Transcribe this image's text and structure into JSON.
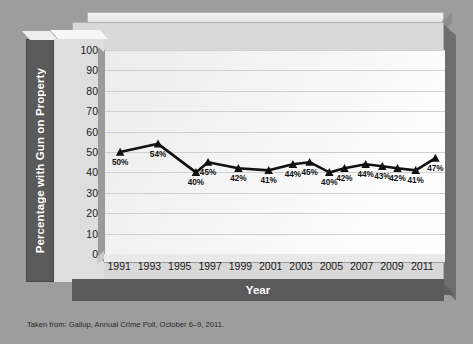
{
  "chart_data": {
    "type": "line",
    "title": "",
    "xlabel": "Year",
    "ylabel": "Percentage with Gun on Property",
    "xlim": [
      1990,
      2012.5
    ],
    "ylim": [
      0,
      100
    ],
    "grid": true,
    "legend": "none",
    "marker": "triangle",
    "line_color": "#111111",
    "x": [
      1991,
      1993.5,
      1996,
      1996.8,
      1998.8,
      2000.8,
      2002.4,
      2003.5,
      2004.8,
      2005.8,
      2007.2,
      2008.3,
      2009.3,
      2010.5,
      2011.8
    ],
    "values": [
      50,
      54,
      40,
      45,
      42,
      41,
      44,
      45,
      40,
      42,
      44,
      43,
      42,
      41,
      47
    ],
    "point_labels": [
      "50%",
      "54%",
      "40%",
      "45%",
      "42%",
      "41%",
      "44%",
      "45%",
      "40%",
      "42%",
      "44%",
      "43%",
      "42%",
      "41%",
      "47%"
    ],
    "label_positions": [
      "below",
      "below",
      "below",
      "below",
      "below",
      "below",
      "below",
      "below",
      "below",
      "below",
      "below",
      "below",
      "below",
      "below",
      "below"
    ],
    "ytick_labels": [
      "100",
      "90",
      "80",
      "70",
      "60",
      "50",
      "40",
      "30",
      "20",
      "10",
      "0"
    ],
    "ytick_values": [
      100,
      90,
      80,
      70,
      60,
      50,
      40,
      30,
      20,
      10,
      0
    ],
    "xtick_labels": [
      "1991",
      "1993",
      "1995",
      "1997",
      "1999",
      "2001",
      "2003",
      "2005",
      "2007",
      "2009",
      "2011"
    ],
    "xtick_values": [
      1991,
      1993,
      1995,
      1997,
      1999,
      2001,
      2003,
      2005,
      2007,
      2009,
      2011
    ]
  },
  "axis_titles": {
    "y": "Percentage with Gun on Property",
    "x": "Year"
  },
  "footnote": {
    "text": "Taken from: Gallup, Annual Crime Poll, October 6–9, 2011."
  },
  "colors": {
    "page_background": "#9d9d9d",
    "frame_background": "#d8d8d8",
    "plot_background": "#f5f5f5",
    "axis_band": "#5a5a5a",
    "gridline": "#cfcfcf",
    "series": "#111111",
    "tick_text": "#1b1b1b",
    "band_text": "#ffffff"
  }
}
